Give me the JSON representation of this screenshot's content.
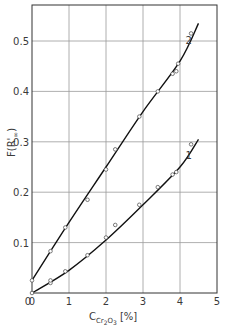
{
  "chart_data": {
    "type": "line",
    "title": "",
    "xlabel": "C_Cr2O3 [%]",
    "xlabel_main": "C",
    "xlabel_sub": "Cr",
    "xlabel_sub2": "2",
    "xlabel_sub3": "O",
    "xlabel_sub4": "3",
    "xlabel_unit": "[%]",
    "ylabel": "F(R'∞)",
    "ylabel_main": "F(R'",
    "ylabel_sub": "∞",
    "ylabel_close": ")",
    "xlim": [
      0,
      5
    ],
    "ylim": [
      0,
      0.57
    ],
    "grid": true,
    "legend_position": "inline curve labels",
    "x_ticks": [
      "0",
      "1",
      "2",
      "3",
      "4",
      "5"
    ],
    "y_ticks": [
      "0",
      "0.1",
      "0.2",
      "0.3",
      "0.4",
      "0.5"
    ],
    "series": [
      {
        "name": "2",
        "label": "2",
        "points": [
          [
            0.0,
            0.025
          ],
          [
            0.5,
            0.083
          ],
          [
            0.9,
            0.13
          ],
          [
            1.5,
            0.185
          ],
          [
            2.0,
            0.245
          ],
          [
            2.25,
            0.285
          ],
          [
            2.9,
            0.35
          ],
          [
            3.4,
            0.4
          ],
          [
            3.8,
            0.435
          ],
          [
            3.9,
            0.44
          ],
          [
            3.95,
            0.455
          ],
          [
            4.3,
            0.515
          ]
        ],
        "fit": [
          [
            0.0,
            0.025
          ],
          [
            1.0,
            0.14
          ],
          [
            2.0,
            0.25
          ],
          [
            3.0,
            0.36
          ],
          [
            4.0,
            0.46
          ],
          [
            4.5,
            0.535
          ]
        ]
      },
      {
        "name": "1",
        "label": "1",
        "points": [
          [
            0.0,
            0.0
          ],
          [
            0.5,
            0.02
          ],
          [
            0.5,
            0.025
          ],
          [
            0.9,
            0.043
          ],
          [
            1.5,
            0.075
          ],
          [
            2.0,
            0.11
          ],
          [
            2.25,
            0.135
          ],
          [
            2.9,
            0.175
          ],
          [
            3.4,
            0.21
          ],
          [
            3.8,
            0.235
          ],
          [
            3.9,
            0.24
          ],
          [
            4.3,
            0.295
          ]
        ],
        "fit": [
          [
            0.0,
            0.0
          ],
          [
            1.0,
            0.045
          ],
          [
            2.0,
            0.105
          ],
          [
            3.0,
            0.175
          ],
          [
            4.0,
            0.25
          ],
          [
            4.5,
            0.305
          ]
        ]
      }
    ]
  }
}
